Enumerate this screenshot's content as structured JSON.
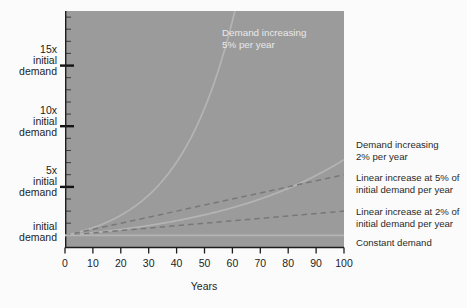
{
  "figure": {
    "plot_bg_color": "#9b9b9b",
    "page_bg_color": "#fbfbfb",
    "axis_color": "#1d1d1d",
    "curve_light_color": "#b9b9b9",
    "curve_dark_color": "#6f6f6f",
    "annotation_light_color": "#e9e9e9",
    "annotation_dark_color": "#2a2a2a"
  },
  "axes": {
    "x_title": "Years",
    "x_ticks": [
      "0",
      "10",
      "20",
      "30",
      "40",
      "50",
      "60",
      "70",
      "80",
      "90",
      "100"
    ],
    "x_min": 0,
    "x_max": 100,
    "y_min": 0,
    "y_max": 19.5,
    "y_labels": [
      {
        "value": 15,
        "line1": "15x",
        "line2": "initial",
        "line3": "demand"
      },
      {
        "value": 10,
        "line1": "10x",
        "line2": "initial",
        "line3": "demand"
      },
      {
        "value": 5,
        "line1": "5x",
        "line2": "initial",
        "line3": "demand"
      },
      {
        "value": 1,
        "line1": "",
        "line2": "initial",
        "line3": "demand"
      }
    ]
  },
  "annotations": {
    "in_plot": {
      "line1": "Demand  increasing",
      "line2": "5% per year"
    },
    "right_side": [
      {
        "id": "exp-2pct",
        "line1": "Demand increasing",
        "line2": "2% per year"
      },
      {
        "id": "linear-5pct",
        "line1": "Linear increase at 5% of",
        "line2": "initial demand per year"
      },
      {
        "id": "linear-2pct",
        "line1": "Linear increase at 2% of",
        "line2": "initial demand per year"
      },
      {
        "id": "constant",
        "line1": "Constant demand",
        "line2": ""
      }
    ]
  },
  "chart_data": {
    "type": "line",
    "title": "",
    "xlabel": "Years",
    "ylabel": "Multiples of initial demand",
    "xlim": [
      0,
      100
    ],
    "ylim": [
      0,
      19.5
    ],
    "grid": false,
    "legend_position": "right-outside-and-inline",
    "x": [
      0,
      10,
      20,
      30,
      40,
      50,
      60,
      70,
      80,
      90,
      100
    ],
    "series": [
      {
        "name": "Demand increasing 5% per year",
        "style": "solid",
        "label_placement": "in-plot-top",
        "values": [
          1.0,
          1.63,
          2.65,
          4.32,
          7.04,
          11.47,
          18.68,
          30.43,
          49.56,
          80.73,
          131.5
        ]
      },
      {
        "name": "Demand increasing 2% per year",
        "style": "solid",
        "label_placement": "right",
        "values": [
          1.0,
          1.22,
          1.49,
          1.81,
          2.21,
          2.69,
          3.28,
          4.0,
          4.88,
          5.94,
          7.24
        ]
      },
      {
        "name": "Linear increase at 5% of initial demand per year",
        "style": "dashed",
        "label_placement": "right",
        "values": [
          1.0,
          1.5,
          2.0,
          2.5,
          3.0,
          3.5,
          4.0,
          4.5,
          5.0,
          5.5,
          6.0
        ]
      },
      {
        "name": "Linear increase at 2% of initial demand per year",
        "style": "dashed",
        "label_placement": "right",
        "values": [
          1.0,
          1.2,
          1.4,
          1.6,
          1.8,
          2.0,
          2.2,
          2.4,
          2.6,
          2.8,
          3.0
        ]
      },
      {
        "name": "Constant demand",
        "style": "solid",
        "label_placement": "right",
        "values": [
          1.0,
          1.0,
          1.0,
          1.0,
          1.0,
          1.0,
          1.0,
          1.0,
          1.0,
          1.0,
          1.0
        ]
      }
    ]
  }
}
